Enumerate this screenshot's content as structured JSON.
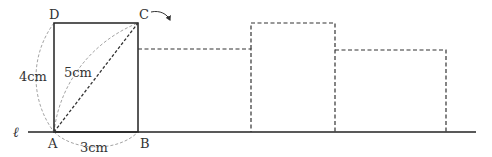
{
  "diagram": {
    "type": "geometry-rolling-rectangle",
    "line_label": "ℓ",
    "vertices": {
      "A": {
        "label": "A"
      },
      "B": {
        "label": "B"
      },
      "C": {
        "label": "C"
      },
      "D": {
        "label": "D"
      }
    },
    "measurements": {
      "side_AD": "4cm",
      "diagonal_AC": "5cm",
      "side_AB": "3cm"
    },
    "colors": {
      "solid_line": "#222222",
      "dashed_line": "#333333",
      "guide_arc": "#999999",
      "text": "#333333"
    },
    "positions": [
      {
        "name": "original",
        "style": "solid",
        "width_cm": 3,
        "height_cm": 4
      },
      {
        "name": "roll-1",
        "style": "dashed",
        "width_cm": 4,
        "height_cm": 3
      },
      {
        "name": "roll-2",
        "style": "dashed",
        "width_cm": 3,
        "height_cm": 4
      },
      {
        "name": "roll-3",
        "style": "dashed",
        "width_cm": 4,
        "height_cm": 3
      }
    ]
  }
}
